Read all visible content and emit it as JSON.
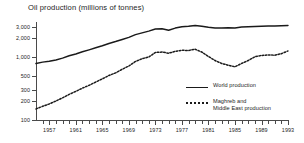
{
  "chart_data": {
    "type": "line",
    "title": "Oil production (millions of tonnes)",
    "xlabel": "",
    "ylabel": "",
    "yscale": "log",
    "ylim": [
      100,
      3600
    ],
    "xlim": [
      1955,
      1993
    ],
    "grid": false,
    "legend_position": "inside-bottom-right",
    "ytick_labels": [
      "100",
      "200",
      "300",
      "500",
      "1,000",
      "2,000",
      "3,000"
    ],
    "ytick_values": [
      100,
      200,
      300,
      500,
      1000,
      2000,
      3000
    ],
    "xtick_labels": [
      "1957",
      "1961",
      "1965",
      "1969",
      "1973",
      "1977",
      "1981",
      "1985",
      "1989",
      "1993"
    ],
    "xtick_values": [
      1957,
      1961,
      1965,
      1969,
      1973,
      1977,
      1981,
      1985,
      1989,
      1993
    ],
    "x": [
      1955,
      1956,
      1957,
      1958,
      1959,
      1960,
      1961,
      1962,
      1963,
      1964,
      1965,
      1966,
      1967,
      1968,
      1969,
      1970,
      1971,
      1972,
      1973,
      1974,
      1975,
      1976,
      1977,
      1978,
      1979,
      1980,
      1981,
      1982,
      1983,
      1984,
      1985,
      1986,
      1987,
      1988,
      1989,
      1990,
      1991,
      1992,
      1993
    ],
    "series": [
      {
        "name": "World production",
        "style": "solid",
        "color": "#1a1a1a",
        "values": [
          790,
          830,
          860,
          900,
          960,
          1050,
          1120,
          1210,
          1300,
          1400,
          1510,
          1640,
          1760,
          1900,
          2050,
          2270,
          2420,
          2580,
          2780,
          2820,
          2660,
          2880,
          3030,
          3080,
          3180,
          3080,
          2960,
          2900,
          2880,
          2920,
          2900,
          2990,
          3020,
          3060,
          3090,
          3120,
          3110,
          3140,
          3180
        ]
      },
      {
        "name": "Maghreb and\nMiddle East production",
        "style": "dotted",
        "color": "#1a1a1a",
        "values": [
          150,
          165,
          180,
          200,
          225,
          255,
          285,
          320,
          355,
          400,
          450,
          510,
          560,
          640,
          720,
          850,
          940,
          1000,
          1180,
          1200,
          1150,
          1230,
          1280,
          1270,
          1330,
          1200,
          1020,
          880,
          790,
          740,
          700,
          790,
          880,
          1010,
          1060,
          1080,
          1070,
          1130,
          1250
        ]
      }
    ]
  }
}
